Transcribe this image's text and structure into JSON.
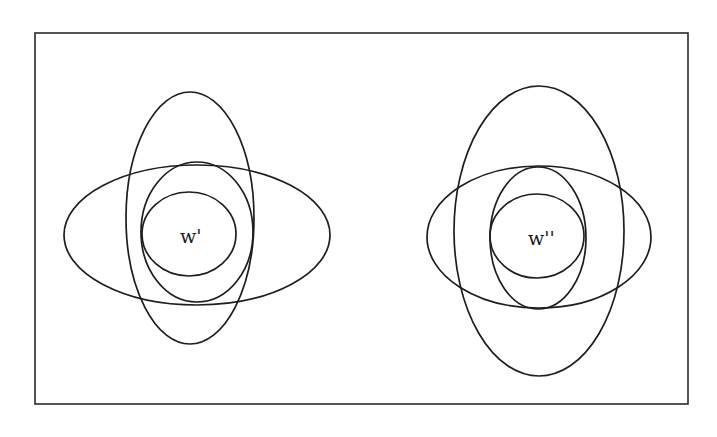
{
  "diagram": {
    "type": "nested-ellipses",
    "frame": {
      "x": 35,
      "y": 33,
      "width": 653,
      "height": 371
    },
    "groups": [
      {
        "name": "world-w-prime",
        "label": "w'",
        "label_pos": {
          "x": 180,
          "y": 243
        },
        "ellipses": [
          {
            "name": "vertical-outer",
            "cx": 190,
            "cy": 218,
            "rx": 64,
            "ry": 126
          },
          {
            "name": "horizontal-outer",
            "cx": 197,
            "cy": 235,
            "rx": 133,
            "ry": 70
          },
          {
            "name": "middle",
            "cx": 197,
            "cy": 232,
            "rx": 56,
            "ry": 70
          },
          {
            "name": "inner",
            "cx": 189,
            "cy": 234,
            "rx": 47,
            "ry": 42
          }
        ]
      },
      {
        "name": "world-w-double-prime",
        "label": "w''",
        "label_pos": {
          "x": 528,
          "y": 245
        },
        "ellipses": [
          {
            "name": "vertical-outer",
            "cx": 539,
            "cy": 231,
            "rx": 85,
            "ry": 145
          },
          {
            "name": "horizontal-outer",
            "cx": 539,
            "cy": 237,
            "rx": 112,
            "ry": 71
          },
          {
            "name": "middle",
            "cx": 538,
            "cy": 238,
            "rx": 48,
            "ry": 71
          },
          {
            "name": "inner",
            "cx": 537,
            "cy": 236,
            "rx": 47,
            "ry": 42
          }
        ]
      }
    ]
  }
}
